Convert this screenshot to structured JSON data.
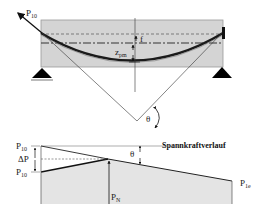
{
  "diagram": {
    "top": {
      "force_label": "P",
      "force_label_sub": "10",
      "eccentricity_label": "f",
      "z_label": "z",
      "z_label_sub": "pm",
      "angle_label": "θ"
    },
    "bottom": {
      "title": "Spannkraftverlauf",
      "p10_label": "P",
      "p10_sub": "10",
      "delta_p_label": "ΔP",
      "p10_prime_label": "P",
      "p10_prime_sub": "10",
      "pn_label": "P",
      "pn_sub": "N",
      "p1e_label": "P",
      "p1e_sub": "1e",
      "angle_label": "θ"
    },
    "colors": {
      "beam_fill": "#d4d4d4",
      "beam_border": "#9a9a9a",
      "tendon": "#1a1a1a",
      "support": "#000000",
      "diagram_fill": "#e4e4e4",
      "line": "#333333"
    }
  }
}
